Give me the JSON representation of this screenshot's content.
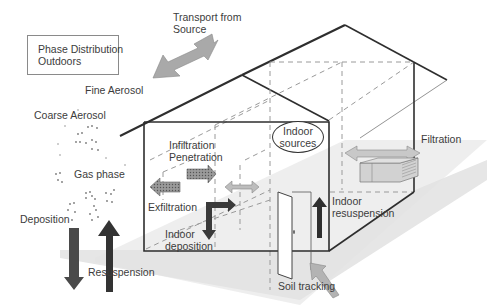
{
  "diagram": {
    "title_box": {
      "line1": "Phase Distribution",
      "line2": "Outdoors"
    },
    "labels": {
      "transport_line1": "Transport from",
      "transport_line2": "Source",
      "fine_aerosol": "Fine Aerosol",
      "coarse_aerosol": "Coarse Aerosol",
      "gas_phase": "Gas phase",
      "deposition": "Deposition",
      "resuspension": "Resuspension",
      "infiltration": "Infiltration",
      "penetration": "Penetration",
      "exfiltration": "Exfiltration",
      "indoor_deposition_line1": "Indoor",
      "indoor_deposition_line2": "deposition",
      "indoor_sources_line1": "Indoor",
      "indoor_sources_line2": "sources",
      "filtration": "Filtration",
      "indoor_resuspension_line1": "Indoor",
      "indoor_resuspension_line2": "resuspension",
      "soil_tracking": "Soil tracking"
    },
    "colors": {
      "line": "#2e2e2e",
      "dashed": "#9a9a9a",
      "ground_shade": "#e4e4e4",
      "arrow_light": "#b9b9b9",
      "arrow_dark": "#3a3a3a",
      "arrow_mid": "#8f8f8f"
    }
  }
}
